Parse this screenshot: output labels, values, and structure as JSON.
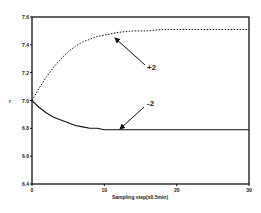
{
  "chart_data": {
    "type": "line",
    "title": "",
    "xlabel": "Sampling step(x0.5min)",
    "ylabel": "r",
    "xlim": [
      0,
      30
    ],
    "ylim": [
      6.4,
      7.6
    ],
    "x_ticks": [
      0,
      10,
      20,
      30
    ],
    "x_tick_labels": [
      "0",
      "10",
      "20",
      "30"
    ],
    "y_ticks": [
      6.4,
      6.6,
      6.8,
      7.0,
      7.2,
      7.4,
      7.6
    ],
    "y_tick_labels": [
      "6.4",
      "6.6",
      "6.8",
      "7.0",
      "7.2",
      "7.4",
      "7.6"
    ],
    "grid": false,
    "legend": "none (inline arrow annotations)",
    "x": [
      0,
      1,
      2,
      3,
      4,
      5,
      6,
      7,
      8,
      9,
      10,
      12,
      14,
      16,
      18,
      20,
      25,
      30
    ],
    "series": [
      {
        "name": "+2",
        "style": "dotted",
        "values": [
          7.0,
          7.09,
          7.17,
          7.24,
          7.3,
          7.35,
          7.39,
          7.42,
          7.44,
          7.46,
          7.47,
          7.49,
          7.5,
          7.5,
          7.51,
          7.51,
          7.51,
          7.51
        ]
      },
      {
        "name": "-2",
        "style": "solid",
        "values": [
          7.0,
          6.95,
          6.91,
          6.88,
          6.86,
          6.84,
          6.82,
          6.81,
          6.8,
          6.8,
          6.79,
          6.79,
          6.79,
          6.79,
          6.79,
          6.79,
          6.79,
          6.79
        ]
      }
    ],
    "annotations": [
      {
        "text": "+2",
        "arrow_to_x": 11,
        "arrow_to_y": 7.48
      },
      {
        "text": "-2",
        "arrow_to_x": 12,
        "arrow_to_y": 6.79
      }
    ]
  }
}
